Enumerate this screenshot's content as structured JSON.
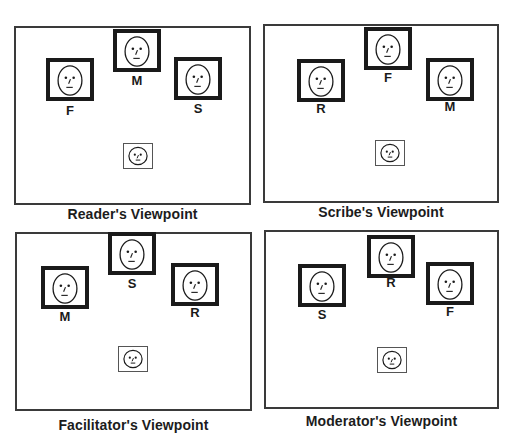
{
  "panels": [
    {
      "caption": "Reader's Viewpoint",
      "participants": [
        {
          "label": "F",
          "role": "Facilitator"
        },
        {
          "label": "M",
          "role": "Moderator"
        },
        {
          "label": "S",
          "role": "Scribe"
        }
      ],
      "self_view": "own-face-thumbnail"
    },
    {
      "caption": "Scribe's Viewpoint",
      "participants": [
        {
          "label": "R",
          "role": "Reader"
        },
        {
          "label": "F",
          "role": "Facilitator"
        },
        {
          "label": "M",
          "role": "Moderator"
        }
      ],
      "self_view": "own-face-thumbnail"
    },
    {
      "caption": "Facilitator's Viewpoint",
      "participants": [
        {
          "label": "M",
          "role": "Moderator"
        },
        {
          "label": "S",
          "role": "Scribe"
        },
        {
          "label": "R",
          "role": "Reader"
        }
      ],
      "self_view": "own-face-thumbnail"
    },
    {
      "caption": "Moderator's Viewpoint",
      "participants": [
        {
          "label": "S",
          "role": "Scribe"
        },
        {
          "label": "R",
          "role": "Reader"
        },
        {
          "label": "F",
          "role": "Facilitator"
        }
      ],
      "self_view": "own-face-thumbnail"
    }
  ],
  "icons": {
    "participant": "face-icon",
    "self": "face-icon"
  }
}
